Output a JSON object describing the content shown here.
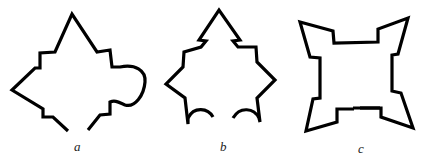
{
  "figure": {
    "panels": [
      {
        "label": "a",
        "description": "Fortress outline with pointed top, stepped bastions and a rounded bump on the right, open at the bottom"
      },
      {
        "label": "b",
        "description": "Star-shaped fortress outline with stepped notches and two arched openings at the bottom"
      },
      {
        "label": "c",
        "description": "Square fortress outline with four pointed corner bastions and a small gap at the bottom"
      }
    ],
    "stroke_color": "#000000",
    "background": "#ffffff"
  }
}
